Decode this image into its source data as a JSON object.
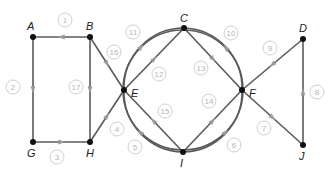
{
  "diagram": {
    "type": "directed-graph",
    "nodes": [
      {
        "id": "A",
        "label": "A",
        "x": 33,
        "y": 37,
        "lx": 27,
        "ly": 30
      },
      {
        "id": "B",
        "label": "B",
        "x": 90,
        "y": 37,
        "lx": 86,
        "ly": 30
      },
      {
        "id": "C",
        "label": "C",
        "x": 184,
        "y": 28,
        "lx": 180,
        "ly": 22
      },
      {
        "id": "D",
        "label": "D",
        "x": 303,
        "y": 39,
        "lx": 299,
        "ly": 32
      },
      {
        "id": "E",
        "label": "E",
        "x": 124,
        "y": 90,
        "lx": 131,
        "ly": 97
      },
      {
        "id": "F",
        "label": "F",
        "x": 242,
        "y": 90,
        "lx": 249,
        "ly": 97
      },
      {
        "id": "G",
        "label": "G",
        "x": 33,
        "y": 142,
        "lx": 27,
        "ly": 157
      },
      {
        "id": "H",
        "label": "H",
        "x": 90,
        "y": 142,
        "lx": 86,
        "ly": 157
      },
      {
        "id": "I",
        "label": "I",
        "x": 183,
        "y": 152,
        "lx": 180,
        "ly": 167
      },
      {
        "id": "J",
        "label": "J",
        "x": 303,
        "y": 145,
        "lx": 299,
        "ly": 160
      }
    ],
    "edges": [
      {
        "number": "1",
        "from": "B",
        "to": "A",
        "shape": "line",
        "bx": 65,
        "by": 20
      },
      {
        "number": "2",
        "from": "A",
        "to": "G",
        "shape": "line",
        "bx": 13,
        "by": 87
      },
      {
        "number": "3",
        "from": "G",
        "to": "H",
        "shape": "line",
        "bx": 57,
        "by": 157
      },
      {
        "number": "4",
        "from": "H",
        "to": "E",
        "shape": "line",
        "bx": 117,
        "by": 129
      },
      {
        "number": "5",
        "from": "I",
        "to": "E",
        "shape": "arc",
        "bx": 135,
        "by": 147
      },
      {
        "number": "6",
        "from": "I",
        "to": "F",
        "shape": "arc",
        "bx": 234,
        "by": 145
      },
      {
        "number": "7",
        "from": "F",
        "to": "J",
        "shape": "line",
        "bx": 264,
        "by": 128
      },
      {
        "number": "8",
        "from": "J",
        "to": "D",
        "shape": "line",
        "bx": 317,
        "by": 92
      },
      {
        "number": "9",
        "from": "D",
        "to": "F",
        "shape": "line",
        "bx": 270,
        "by": 48
      },
      {
        "number": "10",
        "from": "F",
        "to": "C",
        "shape": "arc",
        "bx": 231,
        "by": 33
      },
      {
        "number": "11",
        "from": "E",
        "to": "C",
        "shape": "arc",
        "bx": 133,
        "by": 32
      },
      {
        "number": "12",
        "from": "E",
        "to": "C",
        "shape": "line",
        "bx": 159,
        "by": 74
      },
      {
        "number": "13",
        "from": "C",
        "to": "F",
        "shape": "line",
        "bx": 201,
        "by": 68
      },
      {
        "number": "14",
        "from": "I",
        "to": "F",
        "shape": "line",
        "bx": 209,
        "by": 101
      },
      {
        "number": "15",
        "from": "I",
        "to": "E",
        "shape": "line",
        "bx": 165,
        "by": 111
      },
      {
        "number": "16",
        "from": "B",
        "to": "E",
        "shape": "line",
        "bx": 114,
        "by": 52
      },
      {
        "number": "17",
        "from": "B",
        "to": "H",
        "shape": "line",
        "bx": 76,
        "by": 87
      }
    ],
    "circle": {
      "cx": 183,
      "cy": 90,
      "r": 60
    },
    "colors": {
      "edge": "#5a5a5a",
      "arrow": "#9a9a9a",
      "node": "#111111",
      "badge_text": "#b5b5b5",
      "badge_border": "#cfcfcf"
    }
  }
}
